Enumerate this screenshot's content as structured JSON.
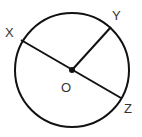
{
  "diagram": {
    "type": "circle-geometry",
    "colors": {
      "stroke": "#111111",
      "label": "#333333",
      "background": "#ffffff"
    },
    "circle": {
      "cx": 72,
      "cy": 70,
      "r": 57
    },
    "center": {
      "label": "O",
      "x": 72,
      "y": 70
    },
    "points": [
      {
        "label": "X",
        "x": 21,
        "y": 40
      },
      {
        "label": "Y",
        "x": 111,
        "y": 27
      },
      {
        "label": "Z",
        "x": 121,
        "y": 98
      }
    ],
    "segments": [
      {
        "name": "diameter-XZ",
        "from": "X",
        "to": "Z"
      },
      {
        "name": "radius-OY",
        "from": "O",
        "to": "Y"
      }
    ]
  }
}
